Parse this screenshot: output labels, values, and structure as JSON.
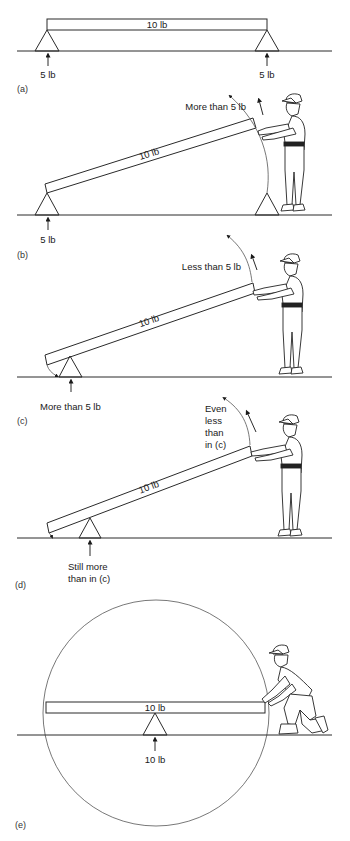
{
  "panels": {
    "a": {
      "label": "(a)",
      "beam_weight": "10 lb",
      "left_support_force": "5 lb",
      "right_support_force": "5 lb"
    },
    "b": {
      "label": "(b)",
      "beam_weight": "10 lb",
      "lift_force": "More than 5 lb",
      "support_force": "5 lb"
    },
    "c": {
      "label": "(c)",
      "beam_weight": "10 lb",
      "lift_force": "Less than 5 lb",
      "support_force": "More than 5 lb"
    },
    "d": {
      "label": "(d)",
      "beam_weight": "10 lb",
      "lift_force_lines": [
        "Even",
        "less",
        "than",
        "in (c)"
      ],
      "support_force_lines": [
        "Still more",
        "than in (c)"
      ]
    },
    "e": {
      "label": "(e)",
      "beam_weight": "10 lb",
      "support_force": "10 lb"
    }
  },
  "colors": {
    "line": "#2a2a2a",
    "background": "#ffffff"
  }
}
